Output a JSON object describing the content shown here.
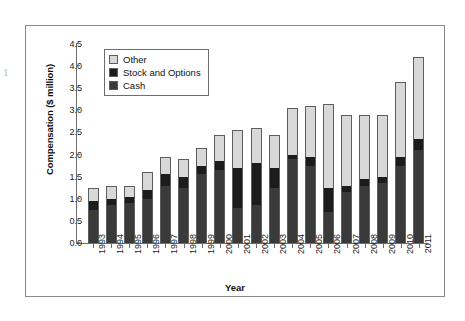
{
  "page_bleed_mark": "1",
  "figure": {
    "ylabel": "Compensation ($ million)",
    "xlabel": "Year"
  },
  "legend": {
    "items": [
      {
        "label": "Other",
        "color": "#d8d8d8"
      },
      {
        "label": "Stock and Options",
        "color": "#1c1c1c"
      },
      {
        "label": "Cash",
        "color": "#3a3a3a"
      }
    ]
  },
  "chart_data": {
    "type": "bar",
    "subtype": "stacked-bar",
    "title": "",
    "xlabel": "Year",
    "ylabel": "Compensation ($ million)",
    "ylim": [
      0.0,
      4.5
    ],
    "ytick_labels": [
      "0.0",
      "0.5",
      "1.0",
      "1.5",
      "2.0",
      "2.5",
      "3.0",
      "3.5",
      "4.0",
      "4.5"
    ],
    "ytick_values": [
      0.0,
      0.5,
      1.0,
      1.5,
      2.0,
      2.5,
      3.0,
      3.5,
      4.0,
      4.5
    ],
    "ytick_step": 0.5,
    "grid": false,
    "legend_position": "upper left (inside axes)",
    "stack_order_bottom_to_top": [
      "Cash",
      "Stock and Options",
      "Other"
    ],
    "categories": [
      "1993",
      "1994",
      "1995",
      "1996",
      "1997",
      "1998",
      "1999",
      "2000",
      "2001",
      "2002",
      "2003",
      "2004",
      "2005",
      "2006",
      "2007",
      "2008",
      "2009",
      "2010",
      "2011"
    ],
    "series": [
      {
        "name": "Cash",
        "color": "#3a3a3a",
        "values": [
          0.75,
          0.85,
          0.9,
          1.0,
          1.3,
          1.25,
          1.55,
          1.65,
          0.8,
          0.85,
          1.25,
          1.9,
          1.75,
          0.7,
          1.15,
          1.3,
          1.35,
          1.75,
          2.1
        ]
      },
      {
        "name": "Stock and Options",
        "color": "#1c1c1c",
        "values": [
          0.2,
          0.15,
          0.15,
          0.2,
          0.25,
          0.25,
          0.2,
          0.2,
          0.9,
          0.95,
          0.45,
          0.1,
          0.2,
          0.55,
          0.15,
          0.15,
          0.15,
          0.2,
          0.25
        ]
      },
      {
        "name": "Other",
        "color": "#d8d8d8",
        "values": [
          0.3,
          0.3,
          0.25,
          0.4,
          0.4,
          0.4,
          0.4,
          0.6,
          0.85,
          0.8,
          0.75,
          1.05,
          1.15,
          1.9,
          1.6,
          1.45,
          1.4,
          1.7,
          1.85
        ]
      }
    ],
    "totals": [
      1.25,
      1.3,
      1.3,
      1.6,
      1.95,
      1.9,
      2.15,
      2.45,
      2.55,
      2.6,
      2.45,
      3.05,
      3.1,
      3.15,
      2.9,
      2.9,
      2.9,
      3.65,
      4.2
    ]
  }
}
